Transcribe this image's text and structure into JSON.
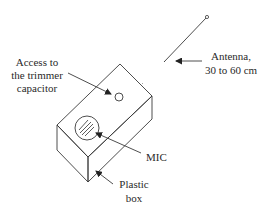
{
  "diagram": {
    "type": "labeled-illustration",
    "colors": {
      "line": "#3a3a3a",
      "text": "#2a2a2a",
      "background": "#ffffff"
    },
    "labels": {
      "trimmer": [
        "Access to",
        "the trimmer",
        "capacitor"
      ],
      "antenna": [
        "Antenna,",
        "30 to 60 cm"
      ],
      "mic": [
        "MIC"
      ],
      "box": [
        "Plastic",
        "box"
      ]
    }
  }
}
